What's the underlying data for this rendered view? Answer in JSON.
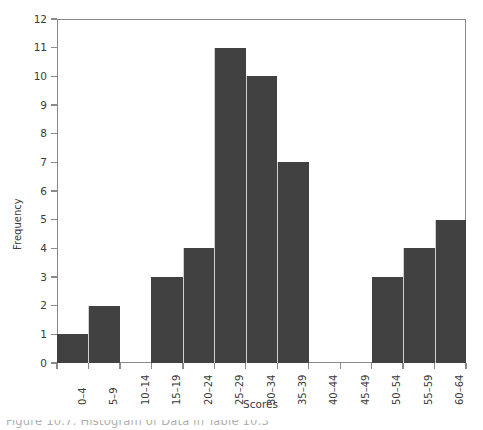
{
  "chart_data": {
    "type": "bar",
    "title": "",
    "subtitle": "",
    "xlabel": "Scores",
    "ylabel": "Frequency",
    "categories": [
      "0–4",
      "5–9",
      "10–14",
      "15–19",
      "20–24",
      "25–29",
      "30–34",
      "35–39",
      "40–44",
      "45–49",
      "50–54",
      "55–59",
      "60–64"
    ],
    "values": [
      1,
      2,
      0,
      3,
      4,
      11,
      10,
      7,
      0,
      0,
      3,
      4,
      5
    ],
    "ylim": [
      0,
      12
    ],
    "ytick_labels": [
      "0",
      "1",
      "2",
      "3",
      "4",
      "5",
      "6",
      "7",
      "8",
      "9",
      "10",
      "11",
      "12"
    ],
    "ytick_values": [
      0,
      1,
      2,
      3,
      4,
      5,
      6,
      7,
      8,
      9,
      10,
      11,
      12
    ],
    "grid": false,
    "legend": false,
    "legend_position": "none",
    "bar_color": "#414141",
    "bar_separator_color": "#cfcfcf",
    "axis_color": "#8a8a8a",
    "text_color": "#3b3b3b",
    "background_color": "#ffffff",
    "xtick_label_rotation": 90,
    "histogram_style": "contiguous-bins"
  },
  "caption": {
    "text": "Figure 10.7: Histogram of Data in Table 10.3",
    "visible_fragment": "Figure 10.7: Histogram of Data in Table 10.3"
  }
}
